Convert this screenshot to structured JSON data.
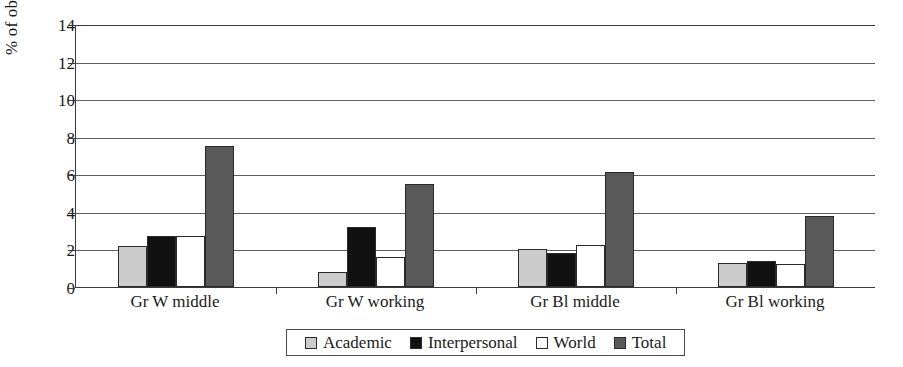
{
  "chart_data": {
    "type": "bar",
    "title": "",
    "subtitle": "",
    "xlabel": "",
    "ylabel": "% of observations",
    "ylim": [
      0,
      14
    ],
    "ytick_step": 2,
    "yticks": [
      0,
      2,
      4,
      6,
      8,
      10,
      12,
      14
    ],
    "grid": true,
    "grid_axis": "y",
    "legend_position": "bottom-center",
    "categories": [
      "Gr W middle",
      "Gr W working",
      "Gr Bl middle",
      "Gr Bl working"
    ],
    "series": [
      {
        "name": "Academic",
        "color": "#cccccc",
        "values": [
          2.2,
          0.8,
          2.0,
          1.3
        ]
      },
      {
        "name": "Interpersonal",
        "color": "#111111",
        "values": [
          2.7,
          3.2,
          1.8,
          1.4
        ]
      },
      {
        "name": "World",
        "color": "#ffffff",
        "values": [
          2.7,
          1.6,
          2.25,
          1.2
        ]
      },
      {
        "name": "Total",
        "color": "#595959",
        "values": [
          7.5,
          5.5,
          6.1,
          3.8
        ]
      }
    ]
  },
  "colors": {
    "axis": "#3a3a3a",
    "gridline": "#5d5d5d",
    "bar_outline": "#2a2a2a",
    "background": "#ffffff"
  }
}
